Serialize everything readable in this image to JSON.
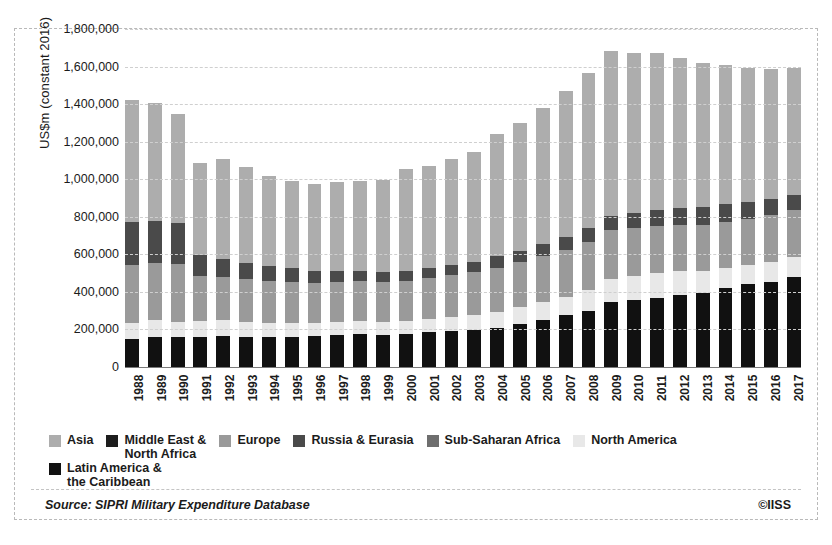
{
  "chart_data": {
    "type": "bar",
    "subtype": "stacked-vertical",
    "title": "",
    "xlabel": "",
    "ylabel": "US$m (constant 2016)",
    "ylim": [
      0,
      1800000
    ],
    "ytick_step": 200000,
    "ytick_labels": [
      "0",
      "200,000",
      "400,000",
      "600,000",
      "800,000",
      "1,000,000",
      "1,200,000",
      "1,400,000",
      "1,600,000",
      "1,800,000"
    ],
    "ytick_values": [
      0,
      200000,
      400000,
      600000,
      800000,
      1000000,
      1200000,
      1400000,
      1600000,
      1800000
    ],
    "grid": "horizontal-dashed",
    "legend_position": "bottom",
    "categories": [
      "1988",
      "1989",
      "1990",
      "1991",
      "1992",
      "1993",
      "1994",
      "1995",
      "1996",
      "1997",
      "1998",
      "1999",
      "2000",
      "2001",
      "2002",
      "2003",
      "2004",
      "2005",
      "2006",
      "2007",
      "2008",
      "2009",
      "2010",
      "2011",
      "2012",
      "2013",
      "2014",
      "2015",
      "2016",
      "2017"
    ],
    "stack_order_bottom_to_top": [
      "Latin America & the Caribbean",
      "North America",
      "Sub-Saharan Africa",
      "Europe",
      "Russia & Eurasia",
      "Middle East & North Africa",
      "Asia"
    ],
    "series": [
      {
        "name": "Latin America & the Caribbean",
        "color": "#111111",
        "values": [
          150000,
          160000,
          160000,
          160000,
          165000,
          160000,
          160000,
          160000,
          165000,
          170000,
          175000,
          170000,
          175000,
          185000,
          190000,
          195000,
          210000,
          230000,
          250000,
          275000,
          300000,
          345000,
          355000,
          370000,
          385000,
          395000,
          420000,
          440000,
          455000,
          480000
        ]
      },
      {
        "name": "North America",
        "color": "#e8e8e8",
        "values": [
          85000,
          90000,
          80000,
          85000,
          85000,
          80000,
          75000,
          75000,
          70000,
          70000,
          70000,
          70000,
          70000,
          70000,
          75000,
          80000,
          85000,
          90000,
          95000,
          100000,
          110000,
          125000,
          130000,
          130000,
          125000,
          115000,
          110000,
          105000,
          105000,
          105000
        ]
      },
      {
        "name": "Sub-Saharan Africa",
        "color": "#6e6e6e",
        "values": [
          0,
          0,
          0,
          0,
          0,
          0,
          0,
          0,
          0,
          0,
          0,
          0,
          0,
          0,
          0,
          0,
          0,
          0,
          0,
          0,
          0,
          0,
          0,
          0,
          0,
          0,
          0,
          0,
          0,
          0
        ]
      },
      {
        "name": "Europe",
        "color": "#9a9a9a",
        "values": [
          310000,
          305000,
          310000,
          240000,
          230000,
          230000,
          225000,
          220000,
          215000,
          215000,
          215000,
          215000,
          215000,
          220000,
          225000,
          230000,
          235000,
          240000,
          245000,
          250000,
          255000,
          260000,
          255000,
          250000,
          245000,
          245000,
          245000,
          245000,
          250000,
          250000
        ]
      },
      {
        "name": "Russia & Eurasia",
        "color": "#4a4a4a",
        "values": [
          230000,
          225000,
          215000,
          110000,
          95000,
          85000,
          80000,
          70000,
          60000,
          55000,
          50000,
          50000,
          50000,
          55000,
          55000,
          55000,
          60000,
          60000,
          65000,
          70000,
          75000,
          75000,
          80000,
          85000,
          90000,
          95000,
          95000,
          90000,
          85000,
          80000
        ]
      },
      {
        "name": "Middle East & North Africa",
        "color": "#2b2b2b",
        "values": [
          0,
          0,
          0,
          0,
          0,
          0,
          0,
          0,
          0,
          0,
          0,
          0,
          0,
          0,
          0,
          0,
          0,
          0,
          0,
          0,
          0,
          0,
          0,
          0,
          0,
          0,
          0,
          0,
          0,
          0
        ]
      },
      {
        "name": "Asia",
        "color": "#adadad",
        "values": [
          645000,
          625000,
          585000,
          490000,
          535000,
          510000,
          475000,
          465000,
          465000,
          475000,
          480000,
          490000,
          545000,
          540000,
          565000,
          585000,
          650000,
          680000,
          725000,
          775000,
          825000,
          880000,
          850000,
          835000,
          800000,
          770000,
          740000,
          710000,
          690000,
          680000
        ]
      }
    ]
  },
  "legend": {
    "items": [
      {
        "label": "Asia",
        "color": "#adadad"
      },
      {
        "label": "Middle East &\nNorth Africa",
        "color": "#1d1d1d"
      },
      {
        "label": "Europe",
        "color": "#9a9a9a"
      },
      {
        "label": "Russia & Eurasia",
        "color": "#4a4a4a"
      },
      {
        "label": "Sub-Saharan Africa",
        "color": "#6e6e6e"
      },
      {
        "label": "North America",
        "color": "#e8e8e8"
      },
      {
        "label": "Latin America &\nthe Caribbean",
        "color": "#111111"
      }
    ]
  },
  "footer": {
    "source": "Source: SIPRI Military Expenditure Database",
    "copyright": "©IISS"
  }
}
